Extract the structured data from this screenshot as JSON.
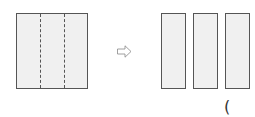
{
  "diagram": {
    "square": {
      "strips": 3,
      "fill": "#f0f0f0",
      "border": "#555555"
    },
    "arrow": {
      "icon": "hollow-right-arrow"
    },
    "rectangles": [
      {
        "id": 1
      },
      {
        "id": 2
      },
      {
        "id": 3
      }
    ],
    "answer_blank": {
      "text": "("
    }
  }
}
